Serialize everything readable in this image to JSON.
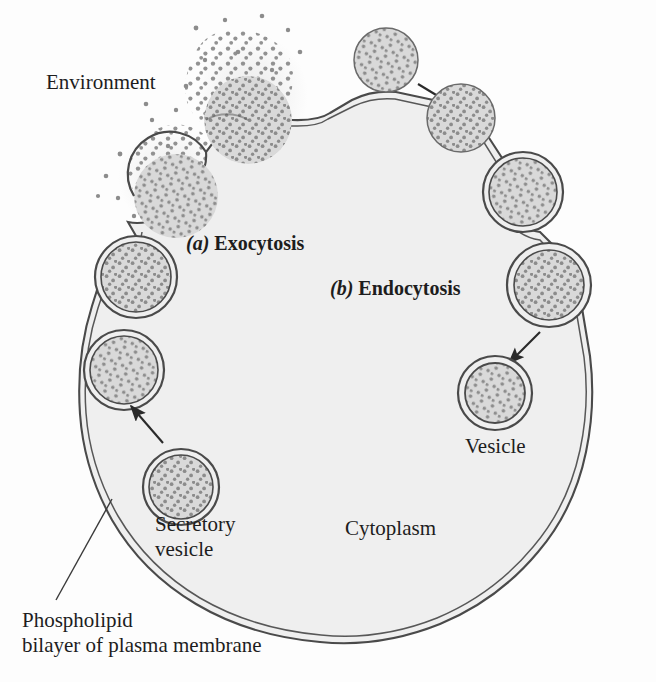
{
  "figure": {
    "type": "cell-biology-diagram"
  },
  "labels": {
    "environment": "Environment",
    "exocytosis_marker": "(a)",
    "exocytosis": "Exocytosis",
    "endocytosis_marker": "(b)",
    "endocytosis": "Endocytosis",
    "vesicle": "Vesicle",
    "cytoplasm": "Cytoplasm",
    "secretory_vesicle": "Secretory\nvesicle",
    "phospholipid": "Phospholipid\nbilayer of plasma membrane"
  },
  "colors": {
    "background": "#fdfdfd",
    "cytoplasm_fill": "#efefef",
    "membrane_line": "#4a4a4a",
    "membrane_fill": "#b8b8b8",
    "vesicle_fill": "#d9d9d9",
    "particle": "#8c8c8c",
    "text": "#1d1d1d",
    "arrow": "#2a2a2a"
  },
  "structures": {
    "cell": {
      "name": "cell-body",
      "membrane_type": "phospholipid bilayer",
      "description": "Large rounded cell occupying most of the frame"
    },
    "exocytosis_sequence": [
      {
        "stage": 1,
        "name": "secretory-vesicle-free",
        "state": "free in cytoplasm",
        "cx": 181,
        "cy": 487,
        "r": 38
      },
      {
        "stage": 2,
        "name": "vesicle-docking",
        "state": "approaching membrane",
        "cx": 124,
        "cy": 370,
        "r": 40
      },
      {
        "stage": 3,
        "name": "vesicle-fusing",
        "state": "fusing with membrane",
        "cx": 136,
        "cy": 277,
        "r": 41
      },
      {
        "stage": 4,
        "name": "vesicle-open-pore",
        "state": "fusion pore open, releasing contents",
        "cx": 176,
        "cy": 196,
        "r": 42
      },
      {
        "stage": 5,
        "name": "contents-released",
        "state": "contents dispersed into environment",
        "cx": 248,
        "cy": 120,
        "r": 42
      }
    ],
    "endocytosis_sequence": [
      {
        "stage": 1,
        "name": "particle-cluster-free",
        "state": "free particle cluster in environment",
        "cx": 386,
        "cy": 60,
        "r": 32
      },
      {
        "stage": 2,
        "name": "particle-at-membrane",
        "state": "contacting membrane",
        "cx": 461,
        "cy": 118,
        "r": 34
      },
      {
        "stage": 3,
        "name": "membrane-invaginating",
        "state": "membrane invaginating around particle",
        "cx": 523,
        "cy": 192,
        "r": 36
      },
      {
        "stage": 4,
        "name": "vesicle-pinching-off",
        "state": "vesicle pinching off from membrane",
        "cx": 549,
        "cy": 285,
        "r": 38
      },
      {
        "stage": 5,
        "name": "vesicle-internalized",
        "state": "free vesicle inside cytoplasm",
        "cx": 495,
        "cy": 393,
        "r": 36
      }
    ],
    "arrows": [
      {
        "name": "arrow-particle-to-membrane",
        "from": [
          418,
          84
        ],
        "to": [
          462,
          110
        ],
        "meaning": "particle moves toward cell surface"
      },
      {
        "name": "arrow-vesicle-internalized",
        "from": [
          540,
          330
        ],
        "to": [
          508,
          362
        ],
        "meaning": "pinched vesicle moves into cytoplasm"
      },
      {
        "name": "arrow-secretory-to-membrane",
        "from": [
          163,
          443
        ],
        "to": [
          130,
          405
        ],
        "meaning": "secretory vesicle travels to membrane"
      }
    ],
    "leader_lines": [
      {
        "name": "leader-phospholipid",
        "from": [
          55,
          600
        ],
        "to": [
          110,
          500
        ],
        "target": "plasma membrane"
      }
    ]
  }
}
